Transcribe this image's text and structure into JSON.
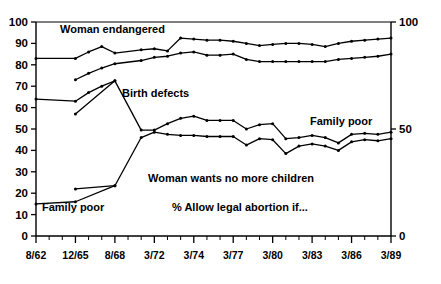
{
  "chart_data": {
    "type": "line",
    "title": "",
    "subtitle": "",
    "xlabel": "",
    "ylabel": "",
    "ylim": [
      0,
      100
    ],
    "ytick_step": 10,
    "grid": false,
    "legend": "inline-annotations",
    "axis_left_ticks": [
      "0",
      "10",
      "20",
      "30",
      "40",
      "50",
      "60",
      "70",
      "80",
      "90",
      "100"
    ],
    "axis_right_ticks": [
      "0",
      "50",
      "100"
    ],
    "x_tick_count": 28,
    "x_label_every": 3,
    "categories": [
      "8/62",
      "12/65",
      "8/68",
      "3/72",
      "3/74",
      "3/77",
      "3/80",
      "3/83",
      "3/86",
      "3/89"
    ],
    "annotations": [
      {
        "name": "woman-endangered-label",
        "text": "Woman endangered",
        "x": 60,
        "y": 33
      },
      {
        "name": "birth-defects-label",
        "text": "Birth defects",
        "x": 122,
        "y": 97
      },
      {
        "name": "family-poor-right-label",
        "text": "Family poor",
        "x": 310,
        "y": 125
      },
      {
        "name": "family-poor-left-label",
        "text": "Family poor",
        "x": 42,
        "y": 211
      },
      {
        "name": "woman-wants-no-more-label",
        "text": "Woman wants no more children",
        "x": 148,
        "y": 182
      },
      {
        "name": "percent-allow-label",
        "text": "% Allow legal abortion if...",
        "x": 172,
        "y": 211
      }
    ],
    "series": [
      {
        "name": "Woman endangered",
        "points": [
          [
            0,
            83
          ],
          [
            3,
            83
          ],
          [
            4,
            86
          ],
          [
            5,
            88.5
          ],
          [
            6,
            85.5
          ],
          [
            8,
            87
          ],
          [
            9,
            87.5
          ],
          [
            10,
            86.5
          ],
          [
            11,
            92.5
          ],
          [
            12,
            92
          ],
          [
            13,
            91.5
          ],
          [
            14,
            91.5
          ],
          [
            15,
            91
          ],
          [
            16,
            90
          ],
          [
            17,
            89
          ],
          [
            18,
            89.5
          ],
          [
            19,
            90
          ],
          [
            20,
            90
          ],
          [
            21,
            89.5
          ],
          [
            22,
            88.5
          ],
          [
            23,
            90
          ],
          [
            24,
            91
          ],
          [
            25,
            91.5
          ],
          [
            26,
            92
          ],
          [
            27,
            92.5
          ]
        ]
      },
      {
        "name": "Birth defects",
        "points": [
          [
            3,
            73
          ],
          [
            4,
            76
          ],
          [
            5,
            78.5
          ],
          [
            6,
            80.5
          ],
          [
            8,
            82
          ],
          [
            9,
            83.5
          ],
          [
            10,
            84
          ],
          [
            11,
            85.5
          ],
          [
            12,
            86
          ],
          [
            13,
            84.5
          ],
          [
            14,
            84.5
          ],
          [
            15,
            85
          ],
          [
            16,
            82.5
          ],
          [
            17,
            81.5
          ],
          [
            18,
            81.5
          ],
          [
            19,
            81.5
          ],
          [
            20,
            81.5
          ],
          [
            21,
            81.5
          ],
          [
            22,
            81.5
          ],
          [
            23,
            82.5
          ],
          [
            24,
            83
          ],
          [
            25,
            83.5
          ],
          [
            26,
            84
          ],
          [
            27,
            85
          ]
        ]
      },
      {
        "name": "Family poor",
        "points": [
          [
            3,
            57
          ],
          [
            6,
            72.5
          ],
          [
            8,
            49.5
          ],
          [
            9,
            49.5
          ],
          [
            10,
            52.5
          ],
          [
            11,
            55
          ],
          [
            12,
            56
          ],
          [
            13,
            54
          ],
          [
            14,
            54
          ],
          [
            15,
            54
          ],
          [
            16,
            50
          ],
          [
            17,
            52
          ],
          [
            18,
            52.5
          ],
          [
            19,
            45.5
          ],
          [
            20,
            46
          ],
          [
            21,
            47
          ],
          [
            22,
            46
          ],
          [
            23,
            43.5
          ],
          [
            24,
            47.5
          ],
          [
            25,
            48
          ],
          [
            26,
            47.5
          ],
          [
            27,
            48.5
          ]
        ]
      },
      {
        "name": "Woman wants no more children",
        "points": [
          [
            3,
            22
          ],
          [
            6,
            23.5
          ],
          [
            8,
            46
          ],
          [
            9,
            48.5
          ],
          [
            10,
            47.5
          ],
          [
            11,
            47
          ],
          [
            12,
            47
          ],
          [
            13,
            46.5
          ],
          [
            14,
            46.5
          ],
          [
            15,
            46.5
          ],
          [
            16,
            42.5
          ],
          [
            17,
            45.5
          ],
          [
            18,
            45
          ],
          [
            19,
            38.5
          ],
          [
            20,
            42
          ],
          [
            21,
            43
          ],
          [
            22,
            42
          ],
          [
            23,
            40
          ],
          [
            24,
            44
          ],
          [
            25,
            45
          ],
          [
            26,
            44.5
          ],
          [
            27,
            45.5
          ]
        ]
      },
      {
        "name": "Family poor (early low)",
        "points": [
          [
            0,
            64
          ],
          [
            3,
            63
          ],
          [
            4,
            67
          ],
          [
            5,
            70
          ],
          [
            6,
            72.5
          ]
        ]
      },
      {
        "name": "Woman wants no more children (early low)",
        "points": [
          [
            0,
            15
          ],
          [
            3,
            16
          ],
          [
            6,
            23.5
          ]
        ]
      }
    ]
  }
}
